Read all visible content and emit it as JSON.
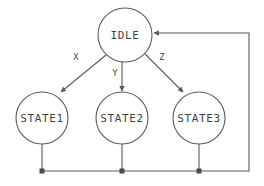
{
  "diagram": {
    "canvas": {
      "width": 264,
      "height": 186,
      "background": "#ffffff"
    },
    "style": {
      "line_color": "#5a5a5a",
      "text_color": "#3f3f3f",
      "fill_color": "#ffffff"
    },
    "nodes": [
      {
        "id": "idle",
        "label": "IDLE",
        "cx": 125,
        "cy": 35,
        "r": 27
      },
      {
        "id": "state1",
        "label": "STATE1",
        "cx": 42,
        "cy": 118,
        "r": 26
      },
      {
        "id": "state2",
        "label": "STATE2",
        "cx": 122,
        "cy": 118,
        "r": 26
      },
      {
        "id": "state3",
        "label": "STATE3",
        "cx": 199,
        "cy": 118,
        "r": 26
      }
    ],
    "edges": [
      {
        "id": "idle-to-state1",
        "from": "IDLE",
        "to": "STATE1",
        "label": "X",
        "label_x": 76,
        "label_y": 57,
        "path": "M 106,55 L 61,92"
      },
      {
        "id": "idle-to-state2",
        "from": "IDLE",
        "to": "STATE2",
        "label": "Y",
        "label_x": 115,
        "label_y": 73,
        "path": "M 122,62 L 122,91"
      },
      {
        "id": "idle-to-state3",
        "from": "IDLE",
        "to": "STATE3",
        "label": "Z",
        "label_x": 162,
        "label_y": 57,
        "path": "M 145,54 L 183,92"
      },
      {
        "id": "state1-return",
        "from": "STATE1",
        "to": "BUS",
        "label": "",
        "label_x": 0,
        "label_y": 0,
        "path": "M 42,144 L 42,171"
      },
      {
        "id": "state2-return",
        "from": "STATE2",
        "to": "BUS",
        "label": "",
        "label_x": 0,
        "label_y": 0,
        "path": "M 122,144 L 122,171"
      },
      {
        "id": "state3-return",
        "from": "STATE3",
        "to": "BUS",
        "label": "",
        "label_x": 0,
        "label_y": 0,
        "path": "M 199,144 L 199,171"
      },
      {
        "id": "bus-to-idle",
        "from": "BUS",
        "to": "IDLE",
        "label": "",
        "label_x": 0,
        "label_y": 0,
        "path": "M 42,171 L 249,171 L 249,33 L 154,33"
      }
    ],
    "junctions": [
      {
        "id": "junction-state1",
        "x": 42,
        "y": 171
      },
      {
        "id": "junction-state2",
        "x": 122,
        "y": 171
      },
      {
        "id": "junction-state3",
        "x": 199,
        "y": 171
      }
    ]
  }
}
